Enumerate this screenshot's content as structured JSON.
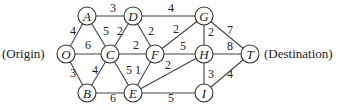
{
  "diagram": {
    "type": "weighted-graph",
    "labels": {
      "origin": "(Origin)",
      "destination": "(Destination)"
    },
    "nodes": [
      "O",
      "A",
      "B",
      "C",
      "D",
      "E",
      "F",
      "G",
      "H",
      "I",
      "T"
    ],
    "edges": [
      {
        "from": "O",
        "to": "A",
        "weight": "4"
      },
      {
        "from": "O",
        "to": "C",
        "weight": "6"
      },
      {
        "from": "O",
        "to": "B",
        "weight": "3"
      },
      {
        "from": "A",
        "to": "D",
        "weight": "3"
      },
      {
        "from": "A",
        "to": "C",
        "weight": "5"
      },
      {
        "from": "D",
        "to": "C",
        "weight": "2"
      },
      {
        "from": "D",
        "to": "F",
        "weight": "2"
      },
      {
        "from": "D",
        "to": "G",
        "weight": "4"
      },
      {
        "from": "C",
        "to": "F",
        "weight": "2"
      },
      {
        "from": "C",
        "to": "B",
        "weight": "4"
      },
      {
        "from": "C",
        "to": "E",
        "weight": "5"
      },
      {
        "from": "F",
        "to": "E",
        "weight": "1"
      },
      {
        "from": "B",
        "to": "E",
        "weight": "6"
      },
      {
        "from": "F",
        "to": "G",
        "weight": "2"
      },
      {
        "from": "F",
        "to": "H",
        "weight": "5"
      },
      {
        "from": "E",
        "to": "H",
        "weight": "2"
      },
      {
        "from": "E",
        "to": "I",
        "weight": "5"
      },
      {
        "from": "G",
        "to": "H",
        "weight": "2"
      },
      {
        "from": "G",
        "to": "T",
        "weight": "7"
      },
      {
        "from": "H",
        "to": "T",
        "weight": "8"
      },
      {
        "from": "H",
        "to": "I",
        "weight": "3"
      },
      {
        "from": "I",
        "to": "T",
        "weight": "4"
      }
    ]
  }
}
